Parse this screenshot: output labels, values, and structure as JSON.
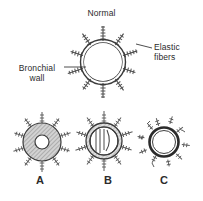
{
  "figure": {
    "title": "Normal",
    "labels": {
      "elastic_fibers_line1": "Elastic",
      "elastic_fibers_line2": "fibers",
      "bronchial_wall_line1": "Bronchial",
      "bronchial_wall_line2": "wall"
    },
    "panels": [
      {
        "id": "a",
        "label": "A"
      },
      {
        "id": "b",
        "label": "B"
      },
      {
        "id": "c",
        "label": "C"
      }
    ],
    "colors": {
      "background": "#ffffff",
      "ink": "#2b2b2b",
      "line": "#3a3a3a",
      "wall_fill": "#b9b9b9",
      "lumen": "#ffffff",
      "fiber": "#4a4a4a"
    }
  }
}
